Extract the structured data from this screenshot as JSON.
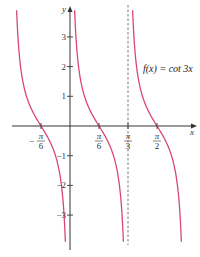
{
  "chart_data": {
    "type": "line",
    "title": "",
    "function_label": "f(x) = cot 3x",
    "xlabel": "x",
    "ylabel": "y",
    "x_ticks": [
      {
        "value": -0.5236,
        "label_num": "π",
        "label_den": "6",
        "sign": "−"
      },
      {
        "value": 0.5236,
        "label_num": "π",
        "label_den": "6",
        "sign": ""
      },
      {
        "value": 1.0472,
        "label_num": "π",
        "label_den": "3",
        "sign": ""
      },
      {
        "value": 1.5708,
        "label_num": "π",
        "label_den": "2",
        "sign": ""
      }
    ],
    "y_ticks": [
      {
        "value": 3,
        "label": "3"
      },
      {
        "value": 2,
        "label": "2"
      },
      {
        "value": 1,
        "label": "1"
      },
      {
        "value": -1,
        "label": "−1"
      },
      {
        "value": -2,
        "label": "−2"
      },
      {
        "value": -3,
        "label": "−3"
      }
    ],
    "asymptotes": [
      -1.0472,
      0,
      1.0472,
      2.0944
    ],
    "dashed_asymptote": 1.0472,
    "xlim": [
      -1.19,
      2.07
    ],
    "ylim": [
      -4.0,
      4.1
    ],
    "series": [
      {
        "name": "cot 3x",
        "color": "#d9467a"
      }
    ],
    "grid": false
  },
  "colors": {
    "curve": "#d9467a",
    "axis": "#333333",
    "dashed": "#555555"
  }
}
